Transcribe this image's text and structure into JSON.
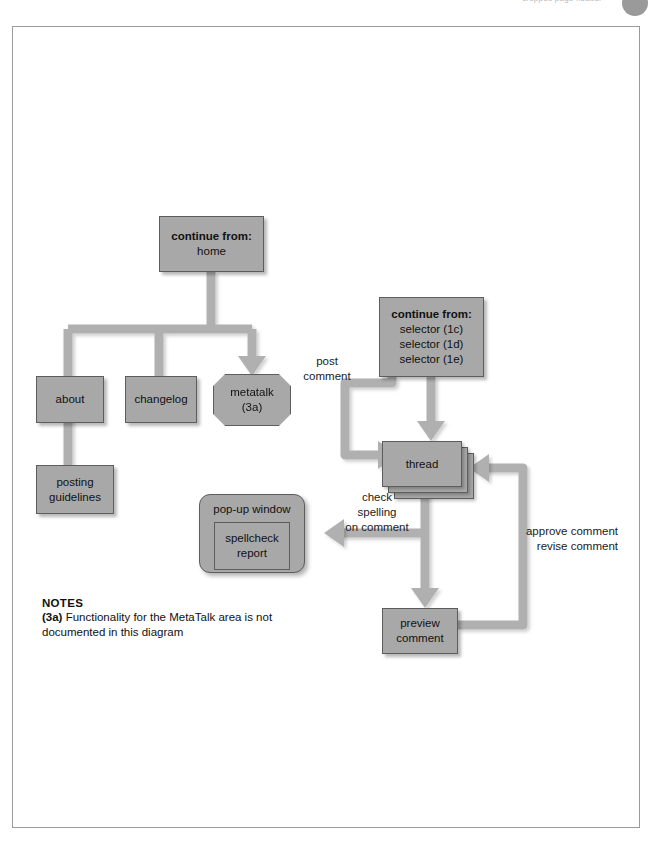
{
  "header": {
    "text": "cropped page header",
    "dot": "page-number-circle"
  },
  "diagram": {
    "colors": {
      "node_fill": "#a8a8a8",
      "node_border": "#5d5d5d",
      "connector": "#b0b0b0",
      "text": "#111111"
    },
    "nodes": [
      {
        "id": "continue-home",
        "title": "continue from:",
        "lines": [
          "home"
        ]
      },
      {
        "id": "about",
        "title": "",
        "lines": [
          "about"
        ]
      },
      {
        "id": "changelog",
        "title": "",
        "lines": [
          "changelog"
        ]
      },
      {
        "id": "metatalk",
        "title": "",
        "lines": [
          "metatalk",
          "(3a)"
        ]
      },
      {
        "id": "posting-guidelines",
        "title": "",
        "lines": [
          "posting",
          "guidelines"
        ]
      },
      {
        "id": "continue-selectors",
        "title": "continue from:",
        "lines": [
          "selector (1c)",
          "selector (1d)",
          "selector (1e)"
        ]
      },
      {
        "id": "thread",
        "title": "",
        "lines": [
          "thread"
        ]
      },
      {
        "id": "preview-comment",
        "title": "",
        "lines": [
          "preview",
          "comment"
        ]
      },
      {
        "id": "popup-window",
        "title": "pop-up window",
        "lines": [
          "spellcheck",
          "report"
        ]
      }
    ],
    "edge_labels": [
      {
        "id": "post-comment",
        "lines": [
          "post",
          "comment"
        ]
      },
      {
        "id": "check-spelling",
        "lines": [
          "check",
          "spelling",
          "on comment"
        ]
      },
      {
        "id": "approve-revise",
        "lines": [
          "approve comment",
          "revise comment"
        ]
      }
    ]
  },
  "notes": {
    "title": "NOTES",
    "ref": "(3a)",
    "body": " Functionality for the MetaTalk area is not documented in this diagram"
  }
}
